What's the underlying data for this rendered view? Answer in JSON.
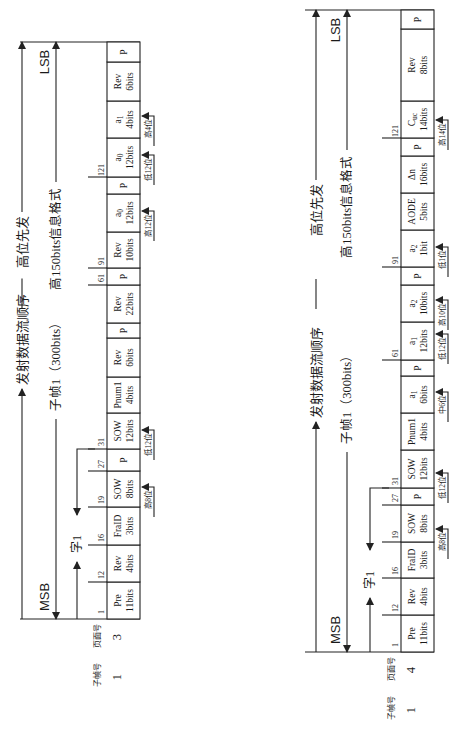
{
  "diagrams": [
    {
      "id": "left",
      "title_line1_left": "发射数据流顺序",
      "title_line1_right": "高位先发",
      "title_line2_left": "子帧1（300bits）",
      "title_line2_right": "高150bits信息格式",
      "msb_label": "MSB",
      "lsb_label": "LSB",
      "word_label": "字1",
      "footer": {
        "subframe_label": "子帧号",
        "page_label": "页面号",
        "subframe_value": "1",
        "page_value": "3"
      },
      "geometry": {
        "table_x": 107,
        "table_w": 33,
        "top": 42,
        "bottom": 619,
        "baseline_x0": 20,
        "arrow1_x": 22,
        "arrow2_x": 56,
        "word_x": 77,
        "tick_x0": 88
      },
      "cells": [
        {
          "name": "Pre",
          "bits": "11bits",
          "y0": 619,
          "y1": 582
        },
        {
          "name": "Rev",
          "bits": "4bits",
          "y0": 582,
          "y1": 545
        },
        {
          "name": "FraID",
          "bits": "3bits",
          "y0": 545,
          "y1": 507
        },
        {
          "name": "SOW",
          "bits": "8bits",
          "y0": 507,
          "y1": 471
        },
        {
          "name": "P",
          "bits": "",
          "y0": 471,
          "y1": 449
        },
        {
          "name": "SOW",
          "bits": "12bits",
          "y0": 449,
          "y1": 413
        },
        {
          "name": "Pnum1",
          "bits": "4bits",
          "y0": 413,
          "y1": 377
        },
        {
          "name": "Rev",
          "bits": "6bits",
          "y0": 377,
          "y1": 338
        },
        {
          "name": "P",
          "bits": "",
          "y0": 338,
          "y1": 323
        },
        {
          "name": "Rev",
          "bits": "22bits",
          "y0": 323,
          "y1": 285
        },
        {
          "name": "P",
          "bits": "",
          "y0": 285,
          "y1": 268
        },
        {
          "name": "Rev",
          "bits": "10bits",
          "y0": 268,
          "y1": 232
        },
        {
          "name": "a0",
          "bits": "12bits",
          "y0": 232,
          "y1": 194
        },
        {
          "name": "P",
          "bits": "",
          "y0": 194,
          "y1": 177
        },
        {
          "name": "a0",
          "bits": "12bits",
          "y0": 177,
          "y1": 138
        },
        {
          "name": "a1",
          "bits": "4bits",
          "y0": 138,
          "y1": 101
        },
        {
          "name": "Rev",
          "bits": "6bits",
          "y0": 101,
          "y1": 62
        },
        {
          "name": "P",
          "bits": "",
          "y0": 62,
          "y1": 42
        }
      ],
      "ticks": [
        {
          "label": "1",
          "y": 619
        },
        {
          "label": "12",
          "y": 582
        },
        {
          "label": "16",
          "y": 545
        },
        {
          "label": "19",
          "y": 507
        },
        {
          "label": "27",
          "y": 471
        },
        {
          "label": "31",
          "y": 449
        },
        {
          "label": "61",
          "y": 285
        },
        {
          "label": "91",
          "y": 268
        },
        {
          "label": "121",
          "y": 177
        }
      ],
      "annotations": [
        {
          "label": "高8位",
          "y": 487
        },
        {
          "label": "低12位",
          "y": 430
        },
        {
          "label": "高12位",
          "y": 211
        },
        {
          "label": "低12位",
          "y": 155
        },
        {
          "label": "高4位",
          "y": 116
        }
      ]
    },
    {
      "id": "right",
      "title_line1_left": "发射数据流顺序",
      "title_line1_right": "高位先发",
      "title_line2_left": "子帧1（300bits）",
      "title_line2_right": "高150bits信息格式",
      "msb_label": "MSB",
      "lsb_label": "LSB",
      "word_label": "字1",
      "footer": {
        "subframe_label": "子帧号",
        "page_label": "页面号",
        "subframe_value": "1",
        "page_value": "4"
      },
      "geometry": {
        "table_x": 401,
        "table_w": 33,
        "top": 10,
        "bottom": 652,
        "baseline_x0": 305,
        "arrow1_x": 316,
        "arrow2_x": 347,
        "word_x": 370,
        "tick_x0": 382
      },
      "cells": [
        {
          "name": "Pre",
          "bits": "11bits",
          "y0": 652,
          "y1": 615
        },
        {
          "name": "Rev",
          "bits": "4bits",
          "y0": 615,
          "y1": 578
        },
        {
          "name": "FraID",
          "bits": "3bits",
          "y0": 578,
          "y1": 542
        },
        {
          "name": "SOW",
          "bits": "8bits",
          "y0": 542,
          "y1": 505
        },
        {
          "name": "P",
          "bits": "",
          "y0": 505,
          "y1": 488
        },
        {
          "name": "SOW",
          "bits": "12bits",
          "y0": 488,
          "y1": 450
        },
        {
          "name": "Pnum1",
          "bits": "4bits",
          "y0": 450,
          "y1": 413
        },
        {
          "name": "a1",
          "bits": "6bits",
          "y0": 413,
          "y1": 376
        },
        {
          "name": "P",
          "bits": "",
          "y0": 376,
          "y1": 360
        },
        {
          "name": "a1",
          "bits": "12bits",
          "y0": 360,
          "y1": 322
        },
        {
          "name": "a2",
          "bits": "10bits",
          "y0": 322,
          "y1": 285
        },
        {
          "name": "P",
          "bits": "",
          "y0": 285,
          "y1": 267
        },
        {
          "name": "a2",
          "bits": "1bit",
          "y0": 267,
          "y1": 230
        },
        {
          "name": "AODE",
          "bits": "5bits",
          "y0": 230,
          "y1": 193
        },
        {
          "name": "Δn",
          "bits": "16bits",
          "y0": 193,
          "y1": 156
        },
        {
          "name": "P",
          "bits": "",
          "y0": 156,
          "y1": 138
        },
        {
          "name": "Cuc",
          "bits": "14bits",
          "y0": 138,
          "y1": 101
        },
        {
          "name": "Rev",
          "bits": "8bits",
          "y0": 101,
          "y1": 29
        },
        {
          "name": "P",
          "bits": "",
          "y0": 29,
          "y1": 10
        }
      ],
      "ticks": [
        {
          "label": "1",
          "y": 652
        },
        {
          "label": "12",
          "y": 615
        },
        {
          "label": "16",
          "y": 578
        },
        {
          "label": "19",
          "y": 542
        },
        {
          "label": "27",
          "y": 505
        },
        {
          "label": "31",
          "y": 488
        },
        {
          "label": "61",
          "y": 360
        },
        {
          "label": "91",
          "y": 267
        },
        {
          "label": "121",
          "y": 138
        }
      ],
      "annotations": [
        {
          "label": "高8位",
          "y": 529
        },
        {
          "label": "低12位",
          "y": 473
        },
        {
          "label": "中6位",
          "y": 392
        },
        {
          "label": "低12位",
          "y": 334
        },
        {
          "label": "高10位",
          "y": 300
        },
        {
          "label": "低1位",
          "y": 247
        },
        {
          "label": "高14位",
          "y": 120
        }
      ]
    }
  ]
}
